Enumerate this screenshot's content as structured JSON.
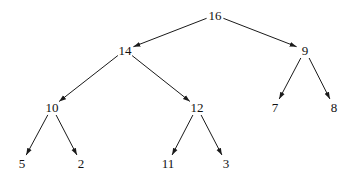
{
  "diagram": {
    "type": "binary-tree",
    "edge_color": "#1a1a1a",
    "nodes": [
      {
        "id": "n16",
        "label": "16",
        "x": 215,
        "y": 15
      },
      {
        "id": "n14",
        "label": "14",
        "x": 125,
        "y": 50
      },
      {
        "id": "n9",
        "label": "9",
        "x": 305,
        "y": 50
      },
      {
        "id": "n10",
        "label": "10",
        "x": 52,
        "y": 107
      },
      {
        "id": "n12",
        "label": "12",
        "x": 197,
        "y": 107
      },
      {
        "id": "n7",
        "label": "7",
        "x": 275,
        "y": 107
      },
      {
        "id": "n8",
        "label": "8",
        "x": 334,
        "y": 107
      },
      {
        "id": "n5",
        "label": "5",
        "x": 22,
        "y": 163
      },
      {
        "id": "n2",
        "label": "2",
        "x": 81,
        "y": 163
      },
      {
        "id": "n11",
        "label": "11",
        "x": 168,
        "y": 163
      },
      {
        "id": "n3",
        "label": "3",
        "x": 226,
        "y": 163
      }
    ],
    "edges": [
      {
        "from": "n16",
        "to": "n14"
      },
      {
        "from": "n16",
        "to": "n9"
      },
      {
        "from": "n14",
        "to": "n10"
      },
      {
        "from": "n14",
        "to": "n12"
      },
      {
        "from": "n9",
        "to": "n7"
      },
      {
        "from": "n9",
        "to": "n8"
      },
      {
        "from": "n10",
        "to": "n5"
      },
      {
        "from": "n10",
        "to": "n2"
      },
      {
        "from": "n12",
        "to": "n11"
      },
      {
        "from": "n12",
        "to": "n3"
      }
    ]
  }
}
